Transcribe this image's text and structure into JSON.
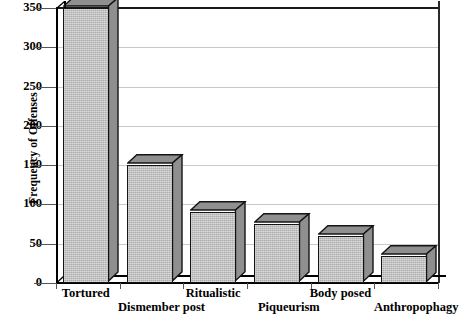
{
  "chart_data": {
    "type": "bar",
    "title": "",
    "subtitle": "",
    "xlabel": "",
    "ylabel": "Frequency of Offenses",
    "categories": [
      "Tortured",
      "Dismember post",
      "Ritualistic",
      "Piqueurism",
      "Body posed",
      "Anthropophagy"
    ],
    "values": [
      350,
      150,
      90,
      75,
      60,
      35
    ],
    "ylim": [
      0,
      350
    ],
    "ytick_labels": [
      "0",
      "50",
      "100",
      "150",
      "200",
      "250",
      "300",
      "350"
    ],
    "ytick_values": [
      0,
      50,
      100,
      150,
      200,
      250,
      300,
      350
    ],
    "grid": true,
    "legend": null,
    "legend_position": "none",
    "style": "3d-column",
    "colors": {
      "bar_face": "#b9b9b9",
      "bar_side": "#8f8f8f",
      "bar_edge": "#141414",
      "gridline": "#c9c9c9",
      "axis": "#000000",
      "background": "#ffffff",
      "text": "#000000"
    }
  },
  "axis": {
    "y_title": "Frequency of Offenses"
  }
}
